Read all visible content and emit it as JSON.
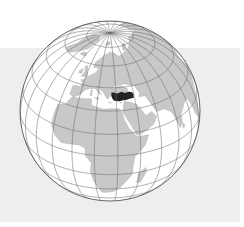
{
  "map": {
    "title": "Turkey location on globe",
    "projection": "orthographic",
    "center_lon": 25,
    "center_lat": 30,
    "cx": 110,
    "cy": 111,
    "radius": 90,
    "graticule_step": 15,
    "colors": {
      "background": "#ffffff",
      "panel": "#eeeeee",
      "ocean": "#ffffff",
      "land": "#c8c8c8",
      "highlight": "#222222",
      "grid": "#6e6e6e",
      "outline": "#555555"
    },
    "highlighted_country": "Turkey",
    "land": [
      {
        "name": "Africa",
        "coords": [
          [
            -17,
            21
          ],
          [
            -16,
            28
          ],
          [
            -10,
            30
          ],
          [
            -6,
            35.8
          ],
          [
            0,
            36
          ],
          [
            10,
            37
          ],
          [
            11,
            33
          ],
          [
            20,
            31
          ],
          [
            25,
            31.5
          ],
          [
            32,
            31.2
          ],
          [
            34,
            29
          ],
          [
            35,
            24
          ],
          [
            38,
            18
          ],
          [
            43,
            12
          ],
          [
            51,
            11.8
          ],
          [
            48,
            5
          ],
          [
            41,
            -2
          ],
          [
            40,
            -10
          ],
          [
            40,
            -16
          ],
          [
            35,
            -24
          ],
          [
            32,
            -29
          ],
          [
            27,
            -34
          ],
          [
            20,
            -35
          ],
          [
            18,
            -33
          ],
          [
            14,
            -23
          ],
          [
            12,
            -13
          ],
          [
            13,
            -6
          ],
          [
            9,
            -1
          ],
          [
            9,
            4
          ],
          [
            5,
            6
          ],
          [
            0,
            5.5
          ],
          [
            -8,
            4.5
          ],
          [
            -13,
            8
          ],
          [
            -17,
            14
          ]
        ]
      },
      {
        "name": "Madagascar",
        "coords": [
          [
            44,
            -25
          ],
          [
            47,
            -25
          ],
          [
            50,
            -15
          ],
          [
            49,
            -12
          ],
          [
            44,
            -16
          ]
        ]
      },
      {
        "name": "Arabia",
        "coords": [
          [
            34.5,
            29.5
          ],
          [
            35,
            28
          ],
          [
            39,
            21
          ],
          [
            43,
            13
          ],
          [
            45,
            13
          ],
          [
            52,
            16
          ],
          [
            56,
            18
          ],
          [
            59,
            22
          ],
          [
            56,
            26
          ],
          [
            51,
            24.5
          ],
          [
            50,
            26
          ],
          [
            48,
            29.5
          ],
          [
            48,
            30
          ],
          [
            45,
            33
          ],
          [
            40,
            35
          ],
          [
            36,
            35.5
          ],
          [
            35,
            32
          ]
        ]
      },
      {
        "name": "Eurasia",
        "coords": [
          [
            -9,
            43
          ],
          [
            -9,
            37
          ],
          [
            -5,
            36
          ],
          [
            0,
            38.5
          ],
          [
            3,
            42
          ],
          [
            7,
            43.5
          ],
          [
            12,
            44
          ],
          [
            16,
            41
          ],
          [
            18,
            40
          ],
          [
            13,
            45.5
          ],
          [
            19,
            42
          ],
          [
            23,
            37.5
          ],
          [
            26,
            40.5
          ],
          [
            28,
            41.2
          ],
          [
            30,
            41
          ],
          [
            36,
            41.5
          ],
          [
            41,
            41
          ],
          [
            40,
            44
          ],
          [
            37,
            45
          ],
          [
            35,
            46
          ],
          [
            30,
            45
          ],
          [
            28,
            44
          ],
          [
            28,
            46
          ],
          [
            33,
            46.5
          ],
          [
            38,
            47
          ],
          [
            47,
            45
          ],
          [
            50,
            40
          ],
          [
            49,
            37
          ],
          [
            54,
            37
          ],
          [
            60,
            25
          ],
          [
            66,
            25
          ],
          [
            72,
            21
          ],
          [
            77,
            8
          ],
          [
            80,
            10
          ],
          [
            80,
            16
          ],
          [
            87,
            21
          ],
          [
            92,
            22
          ],
          [
            95,
            16
          ],
          [
            98,
            8
          ],
          [
            104,
            2
          ],
          [
            110,
            20
          ],
          [
            122,
            30
          ],
          [
            122,
            40
          ],
          [
            140,
            45
          ],
          [
            150,
            60
          ],
          [
            180,
            68
          ],
          [
            180,
            75
          ],
          [
            140,
            73
          ],
          [
            100,
            78
          ],
          [
            70,
            73
          ],
          [
            55,
            70
          ],
          [
            40,
            67
          ],
          [
            32,
            70
          ],
          [
            25,
            71
          ],
          [
            15,
            68
          ],
          [
            5,
            62
          ],
          [
            5,
            58
          ],
          [
            11,
            58
          ],
          [
            10,
            55
          ],
          [
            8,
            54
          ],
          [
            4,
            52
          ],
          [
            2,
            51
          ],
          [
            -2,
            48
          ],
          [
            -4,
            48
          ],
          [
            -1,
            46
          ],
          [
            -2,
            43.5
          ]
        ]
      },
      {
        "name": "Turkey_outline_land",
        "coords": [
          [
            26,
            40
          ],
          [
            30,
            41
          ],
          [
            36,
            41.7
          ],
          [
            41,
            41.3
          ],
          [
            44,
            40
          ],
          [
            44,
            37.5
          ],
          [
            42,
            37
          ],
          [
            36,
            36.5
          ],
          [
            33,
            36.2
          ],
          [
            29,
            36.6
          ],
          [
            27,
            37.8
          ]
        ]
      },
      {
        "name": "Britain",
        "coords": [
          [
            -5,
            50
          ],
          [
            1.5,
            51
          ],
          [
            0,
            54
          ],
          [
            -3,
            58.5
          ],
          [
            -6,
            57
          ],
          [
            -3,
            54.5
          ]
        ]
      },
      {
        "name": "Ireland",
        "coords": [
          [
            -10,
            52
          ],
          [
            -6,
            52
          ],
          [
            -6,
            55
          ],
          [
            -8,
            55
          ]
        ]
      },
      {
        "name": "Scandinavia_island_Iceland",
        "coords": [
          [
            -24,
            64
          ],
          [
            -14,
            64
          ],
          [
            -15,
            66.5
          ],
          [
            -22,
            66.5
          ]
        ]
      },
      {
        "name": "Greenland",
        "coords": [
          [
            -55,
            60
          ],
          [
            -42,
            60
          ],
          [
            -20,
            70
          ],
          [
            -18,
            80
          ],
          [
            -40,
            83
          ],
          [
            -65,
            80
          ],
          [
            -58,
            75
          ],
          [
            -50,
            68
          ]
        ]
      },
      {
        "name": "SriLanka",
        "coords": [
          [
            80,
            6
          ],
          [
            82,
            7
          ],
          [
            81,
            9.5
          ],
          [
            79.8,
            8
          ]
        ]
      },
      {
        "name": "Novaya_Zemlya",
        "coords": [
          [
            52,
            71
          ],
          [
            57,
            71
          ],
          [
            68,
            76
          ],
          [
            60,
            76.5
          ],
          [
            54,
            73.5
          ]
        ]
      },
      {
        "name": "Svalbard",
        "coords": [
          [
            12,
            77
          ],
          [
            22,
            77
          ],
          [
            27,
            80
          ],
          [
            15,
            80
          ]
        ]
      },
      {
        "name": "Cyprus",
        "coords": [
          [
            32.3,
            34.7
          ],
          [
            34.5,
            35.2
          ],
          [
            33,
            35.3
          ]
        ]
      },
      {
        "name": "Crete",
        "coords": [
          [
            23.5,
            35.3
          ],
          [
            26.3,
            35.1
          ],
          [
            24,
            35.6
          ]
        ]
      },
      {
        "name": "Sardinia_Corsica",
        "coords": [
          [
            8.4,
            39
          ],
          [
            9.8,
            39
          ],
          [
            9.5,
            43
          ],
          [
            8.6,
            42.5
          ]
        ]
      },
      {
        "name": "Sicily",
        "coords": [
          [
            12.4,
            37.8
          ],
          [
            15.6,
            37
          ],
          [
            15.3,
            38.3
          ]
        ]
      }
    ],
    "highlight": {
      "name": "Turkey",
      "coords": [
        [
          26.2,
          41.8
        ],
        [
          28,
          41.9
        ],
        [
          31,
          41.1
        ],
        [
          35,
          42
        ],
        [
          38,
          41
        ],
        [
          41.5,
          41.5
        ],
        [
          43.5,
          41.1
        ],
        [
          44.8,
          39.7
        ],
        [
          44.3,
          37.2
        ],
        [
          42.3,
          37.1
        ],
        [
          40,
          36.9
        ],
        [
          36.6,
          36.2
        ],
        [
          36,
          36.8
        ],
        [
          34,
          36.2
        ],
        [
          32,
          36.1
        ],
        [
          30,
          36.3
        ],
        [
          28,
          36.7
        ],
        [
          27.3,
          37.5
        ],
        [
          26.5,
          38.8
        ],
        [
          26.1,
          40.1
        ]
      ]
    }
  }
}
